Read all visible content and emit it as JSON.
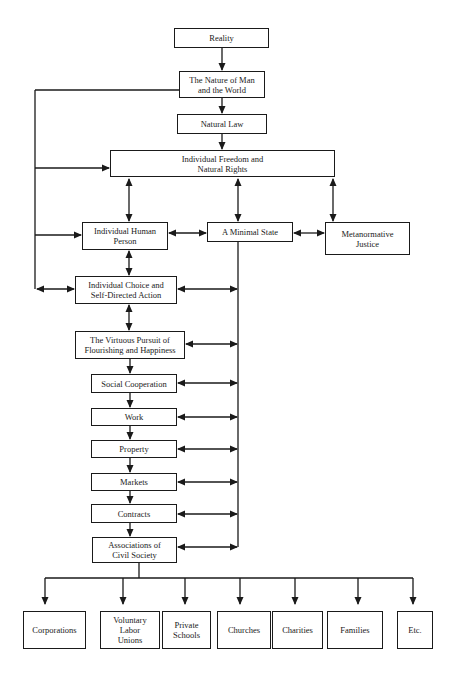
{
  "diagram": {
    "background": "#ffffff",
    "line_color": "#1a1a1a",
    "nodes": {
      "reality": "Reality",
      "nature": "The Nature of Man\nand the World",
      "natural_law": "Natural Law",
      "freedom": "Individual Freedom and\nNatural Rights",
      "human_person": "Individual Human\nPerson",
      "minimal_state": "A Minimal State",
      "metanormative": "Metanormative\nJustice",
      "choice": "Individual Choice and\nSelf-Directed Action",
      "virtuous": "The Virtuous Pursuit of\nFlourishing and Happiness",
      "social": "Social Cooperation",
      "work": "Work",
      "property": "Property",
      "markets": "Markets",
      "contracts": "Contracts",
      "associations": "Associations of\nCivil Society",
      "corporations": "Corporations",
      "unions": "Voluntary\nLabor\nUnions",
      "schools": "Private\nSchools",
      "churches": "Churches",
      "charities": "Charities",
      "families": "Families",
      "etc": "Etc."
    },
    "edges": [
      {
        "from": "Reality",
        "to": "The Nature of Man and the World",
        "type": "arrow"
      },
      {
        "from": "The Nature of Man and the World",
        "to": "Natural Law",
        "type": "arrow"
      },
      {
        "from": "Natural Law",
        "to": "Individual Freedom and Natural Rights",
        "type": "arrow"
      },
      {
        "from": "The Nature of Man and the World",
        "to": "Individual Freedom and Natural Rights",
        "type": "arrow"
      },
      {
        "from": "The Nature of Man and the World",
        "to": "Individual Human Person",
        "type": "arrow"
      },
      {
        "from": "The Nature of Man and the World",
        "to": "Individual Choice and Self-Directed Action",
        "type": "double-arrow"
      },
      {
        "from": "Individual Freedom and Natural Rights",
        "to": "Individual Human Person",
        "type": "double-arrow"
      },
      {
        "from": "Individual Freedom and Natural Rights",
        "to": "A Minimal State",
        "type": "double-arrow"
      },
      {
        "from": "Individual Freedom and Natural Rights",
        "to": "Metanormative Justice",
        "type": "double-arrow"
      },
      {
        "from": "Individual Human Person",
        "to": "A Minimal State",
        "type": "double-arrow"
      },
      {
        "from": "A Minimal State",
        "to": "Metanormative Justice",
        "type": "double-arrow"
      },
      {
        "from": "Individual Human Person",
        "to": "Individual Choice and Self-Directed Action",
        "type": "double-arrow"
      },
      {
        "from": "Individual Choice and Self-Directed Action",
        "to": "The Virtuous Pursuit of Flourishing and Happiness",
        "type": "double-arrow"
      },
      {
        "from": "The Virtuous Pursuit of Flourishing and Happiness",
        "to": "Social Cooperation",
        "type": "arrow"
      },
      {
        "from": "Social Cooperation",
        "to": "Work",
        "type": "arrow"
      },
      {
        "from": "Work",
        "to": "Property",
        "type": "arrow"
      },
      {
        "from": "Property",
        "to": "Markets",
        "type": "arrow"
      },
      {
        "from": "Markets",
        "to": "Contracts",
        "type": "arrow"
      },
      {
        "from": "Contracts",
        "to": "Associations of Civil Society",
        "type": "arrow"
      },
      {
        "from": "A Minimal State",
        "to": "Individual Choice and Self-Directed Action",
        "type": "double-arrow"
      },
      {
        "from": "A Minimal State",
        "to": "The Virtuous Pursuit of Flourishing and Happiness",
        "type": "double-arrow"
      },
      {
        "from": "A Minimal State",
        "to": "Social Cooperation",
        "type": "double-arrow"
      },
      {
        "from": "A Minimal State",
        "to": "Work",
        "type": "double-arrow"
      },
      {
        "from": "A Minimal State",
        "to": "Property",
        "type": "double-arrow"
      },
      {
        "from": "A Minimal State",
        "to": "Markets",
        "type": "double-arrow"
      },
      {
        "from": "A Minimal State",
        "to": "Contracts",
        "type": "double-arrow"
      },
      {
        "from": "A Minimal State",
        "to": "Associations of Civil Society",
        "type": "double-arrow"
      },
      {
        "from": "Associations of Civil Society",
        "to": "Corporations",
        "type": "arrow"
      },
      {
        "from": "Associations of Civil Society",
        "to": "Voluntary Labor Unions",
        "type": "arrow"
      },
      {
        "from": "Associations of Civil Society",
        "to": "Private Schools",
        "type": "arrow"
      },
      {
        "from": "Associations of Civil Society",
        "to": "Churches",
        "type": "arrow"
      },
      {
        "from": "Associations of Civil Society",
        "to": "Charities",
        "type": "arrow"
      },
      {
        "from": "Associations of Civil Society",
        "to": "Families",
        "type": "arrow"
      },
      {
        "from": "Associations of Civil Society",
        "to": "Etc.",
        "type": "arrow"
      }
    ]
  }
}
